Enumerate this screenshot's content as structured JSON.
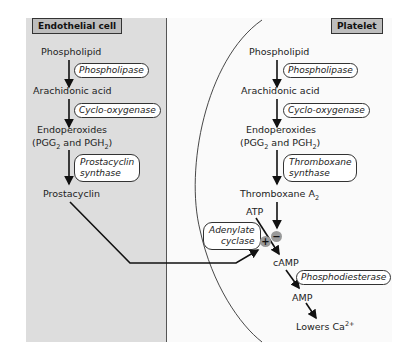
{
  "endothelial": {
    "title": "Endothelial cell",
    "phospholipid": "Phospholipid",
    "phospholipase": "Phospholipase",
    "arachidonic": "Arachidonic acid",
    "cox": "Cyclo-oxygenase",
    "endo1": "Endoperoxides",
    "endo2_a": "(PGG",
    "endo2_sub1": "2",
    "endo2_b": " and PGH",
    "endo2_sub2": "2",
    "endo2_c": ")",
    "synthase_1": "Prostacyclin",
    "synthase_2": "synthase",
    "product": "Prostacyclin"
  },
  "platelet": {
    "title": "Platelet",
    "phospholipid": "Phospholipid",
    "phospholipase": "Phospholipase",
    "arachidonic": "Arachidonic acid",
    "cox": "Cyclo-oxygenase",
    "endo1": "Endoperoxides",
    "endo2_a": "(PGG",
    "endo2_sub1": "2",
    "endo2_b": " and PGH",
    "endo2_sub2": "2",
    "endo2_c": ")",
    "synthase_1": "Thromboxane",
    "synthase_2": "synthase",
    "product_a": "Thromboxane A",
    "product_sub": "2",
    "atp": "ATP",
    "adenylate_1": "Adenylate",
    "adenylate_2": "cyclase",
    "plus": "+",
    "minus": "−",
    "camp": "cAMP",
    "pde": "Phosphodiesterase",
    "amp": "AMP",
    "lowers_a": "Lowers Ca",
    "lowers_sup": "2+"
  }
}
